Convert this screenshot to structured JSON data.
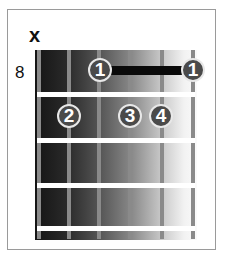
{
  "chord_diagram": {
    "start_fret_label": "8",
    "muted_marker": "x",
    "muted_string": 1,
    "strings": 6,
    "frets_shown": 4,
    "barre": {
      "finger": "1",
      "fret": 1,
      "from_string": 3,
      "to_string": 6
    },
    "fingers": [
      {
        "label": "1",
        "string": 3,
        "fret": 1
      },
      {
        "label": "1",
        "string": 6,
        "fret": 1
      },
      {
        "label": "2",
        "string": 2,
        "fret": 2
      },
      {
        "label": "3",
        "string": 4,
        "fret": 2
      },
      {
        "label": "4",
        "string": 5,
        "fret": 2
      }
    ],
    "colors": {
      "finger_dot": "#4a4a4a",
      "barre": "#0a0a0a",
      "string": "#8a8a8a",
      "fret": "#ffffff",
      "frame": "#9a9a9a"
    }
  }
}
